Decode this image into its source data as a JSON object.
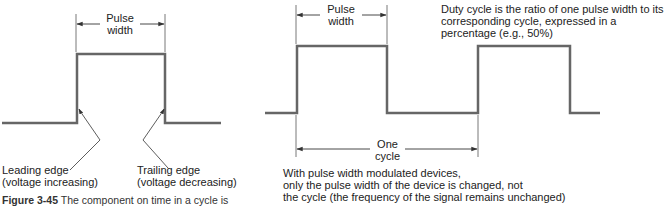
{
  "left_diagram": {
    "pulse_width_label_line1": "Pulse",
    "pulse_width_label_line2": "width",
    "leading_edge_line1": "Leading edge",
    "leading_edge_line2": "(voltage increasing)",
    "trailing_edge_line1": "Trailing edge",
    "trailing_edge_line2": "(voltage decreasing)"
  },
  "right_diagram": {
    "pulse_width_label_line1": "Pulse",
    "pulse_width_label_line2": "width",
    "duty_cycle_line1": "Duty cycle is the ratio of one pulse width to its",
    "duty_cycle_line2": "corresponding cycle, expressed in a",
    "duty_cycle_line3": "percentage (e.g., 50%)",
    "cycle_label_line1": "One",
    "cycle_label_line2": "cycle",
    "pwm_note_line1": "With pulse width modulated devices,",
    "pwm_note_line2": "only the pulse width of the device is changed, not",
    "pwm_note_line3": "the cycle (the frequency of the signal remains unchanged)"
  },
  "caption": {
    "figure_number": "Figure 3-45",
    "text": "The component on time in a cycle is"
  },
  "colors": {
    "waveform": "#666666",
    "annotation": "#333333",
    "text": "#222222"
  }
}
